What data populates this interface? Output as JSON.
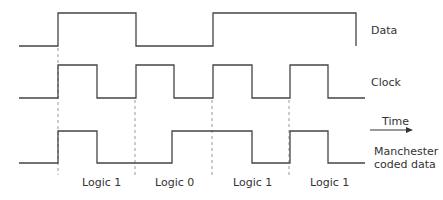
{
  "diagram": {
    "stroke_color": "#444444",
    "signals": [
      {
        "name": "Data",
        "label": "Data",
        "points": "19,46 58,46 58,13 136,13 136,46 213,46 213,13 356,13 356,46"
      },
      {
        "name": "Clock",
        "label": "Clock",
        "points": "19,98 58,98 58,65 97,65 97,98 136,98 136,65 174,65 174,98 213,98 213,65 252,65 252,98 290,98 290,65 328,65 328,98 365,98"
      },
      {
        "name": "Manchester coded data",
        "label_line1": "Manchester",
        "label_line2": "coded data",
        "points": "19,163 58,163 58,131 97,131 97,163 172,163 172,131 252,131 252,163 290,163 290,131 328,131 328,163 365,163"
      }
    ],
    "bit_boundaries_x": [
      58,
      135,
      212,
      289
    ],
    "bits": [
      {
        "label": "Logic 1",
        "x": 63
      },
      {
        "label": "Logic 0",
        "x": 141
      },
      {
        "label": "Logic 1",
        "x": 218
      },
      {
        "label": "Logic 1",
        "x": 296
      }
    ],
    "time_axis": {
      "label": "Time",
      "arrow": "right-arrow"
    }
  }
}
